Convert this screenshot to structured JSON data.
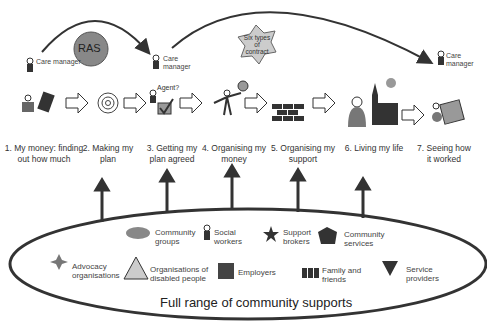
{
  "top": {
    "care_manager_1": "Care manager",
    "care_manager_2": "Care manager",
    "care_manager_3": "Care manager",
    "ras": "RAS",
    "contract": "Six types of contract",
    "agent": "Agent?"
  },
  "steps": [
    {
      "label": "1. My money: finding out how much"
    },
    {
      "label": "2. Making my plan"
    },
    {
      "label": "3. Getting my plan agreed"
    },
    {
      "label": "4. Organising my money"
    },
    {
      "label": "5. Organising my support"
    },
    {
      "label": "6. Living my life"
    },
    {
      "label": "7. Seeing how it worked"
    }
  ],
  "supports": {
    "title": "Full range of community supports",
    "items": [
      {
        "label": "Community groups"
      },
      {
        "label": "Social workers"
      },
      {
        "label": "Support brokers"
      },
      {
        "label": "Community services"
      },
      {
        "label": "Advocacy organisations"
      },
      {
        "label": "Organisations of disabled people"
      },
      {
        "label": "Employers"
      },
      {
        "label": "Family and friends"
      },
      {
        "label": "Service providers"
      }
    ]
  },
  "colors": {
    "dark": "#333333",
    "mid": "#777777",
    "light": "#cccccc"
  }
}
